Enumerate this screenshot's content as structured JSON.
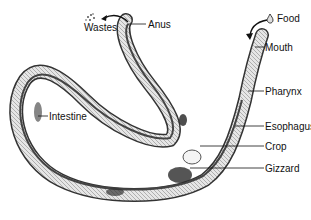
{
  "diagram": {
    "labels": {
      "wastes": "Wastes",
      "anus": "Anus",
      "food": "Food",
      "mouth": "Mouth",
      "pharynx": "Pharynx",
      "esophagus": "Esophagus",
      "crop": "Crop",
      "gizzard": "Gizzard",
      "intestine": "Intestine"
    },
    "colors": {
      "line": "#111111",
      "body_fill": "#d9d9d9",
      "body_stroke": "#333333",
      "dark_gut": "#222222"
    }
  }
}
